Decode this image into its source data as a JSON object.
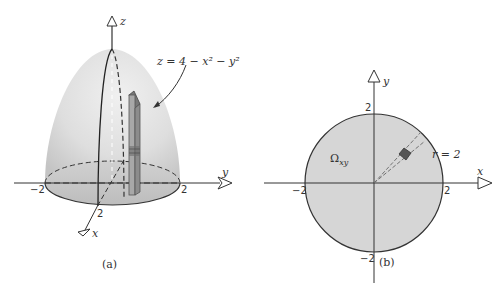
{
  "panel_a": {
    "caption": "(a)",
    "surface_equation": "z = 4 − x² − y²",
    "axes": {
      "z_label": "z",
      "y_label": "y",
      "x_label": "x"
    },
    "ticks": {
      "y_neg": "−2",
      "y_pos": "2",
      "x_pos": "2"
    }
  },
  "panel_b": {
    "caption": "(b)",
    "region_label": "Ω",
    "region_subscript": "xy",
    "radius_label": "r = 2",
    "axes": {
      "y_label": "y",
      "x_label": "x"
    },
    "ticks": {
      "y_pos": "2",
      "y_neg": "−2",
      "x_neg": "−2",
      "x_pos": "2"
    }
  },
  "colors": {
    "surface_fill": "#dcdcdc",
    "disk_fill": "#d6d6d6",
    "line": "#333333",
    "column_fill": "#9a9a9a",
    "sector_fill": "#555555"
  }
}
